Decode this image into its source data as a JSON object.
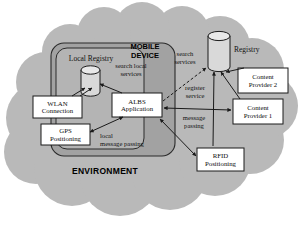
{
  "diagram": {
    "title_environment": "ENVIRONMENT",
    "title_mobile_device_line1": "MOBILE",
    "title_mobile_device_line2": "DEVICE",
    "colors": {
      "environment_cloud_fill": "#b8b8b8",
      "mobile_device_fill": "#9e9e9e",
      "local_registry_panel_fill": "#b0b0b0",
      "box_fill": "#ffffff",
      "stroke": "#1a1a1a",
      "text": "#111111"
    },
    "nodes": [
      {
        "id": "local-registry",
        "label": "Local Registry",
        "shape": "cylinder"
      },
      {
        "id": "registry",
        "label": "Registry",
        "shape": "cylinder"
      },
      {
        "id": "wlan-connection",
        "label_line1": "WLAN",
        "label_line2": "Connection",
        "shape": "box"
      },
      {
        "id": "gps-positioning",
        "label_line1": "GPS",
        "label_line2": "Positioning",
        "shape": "box"
      },
      {
        "id": "albs-application",
        "label_line1": "ALBS",
        "label_line2": "Application",
        "shape": "box"
      },
      {
        "id": "content-provider-2",
        "label_line1": "Content",
        "label_line2": "Provider 2",
        "shape": "box"
      },
      {
        "id": "content-provider-1",
        "label_line1": "Content",
        "label_line2": "Provider 1",
        "shape": "box"
      },
      {
        "id": "rfid-positioning",
        "label_line1": "RFID",
        "label_line2": "Positioning",
        "shape": "box"
      }
    ],
    "edge_labels": [
      {
        "id": "search-local-services",
        "line1": "search local",
        "line2": "services"
      },
      {
        "id": "search-services",
        "line1": "search",
        "line2": "services"
      },
      {
        "id": "register-service",
        "line1": "register",
        "line2": "service"
      },
      {
        "id": "message-passing",
        "line1": "message",
        "line2": "passing"
      },
      {
        "id": "local-message-passing",
        "line1": "local",
        "line2": "message passing"
      }
    ]
  }
}
